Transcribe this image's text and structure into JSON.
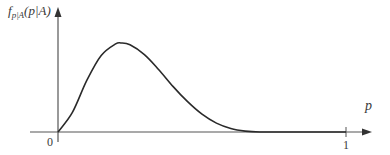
{
  "chart_data": {
    "type": "line",
    "title": "",
    "xlabel": "p",
    "ylabel": "f_{p|A}(p|A)",
    "ylabel_parts": {
      "f": "f",
      "sub": "p|A",
      "arg": "(p|A)"
    },
    "x_ticks": [
      {
        "value": 0,
        "label": "0"
      },
      {
        "value": 1,
        "label": "1"
      }
    ],
    "y_ticks": [],
    "xlim": [
      0,
      1.08
    ],
    "grid": false,
    "legend": null,
    "series": [
      {
        "name": "posterior density",
        "x": [
          0.0,
          0.05,
          0.1,
          0.15,
          0.2,
          0.22,
          0.25,
          0.3,
          0.35,
          0.4,
          0.45,
          0.5,
          0.55,
          0.6,
          0.65,
          0.7,
          0.8,
          0.9,
          1.0
        ],
        "y": [
          0.0,
          0.22,
          0.58,
          0.86,
          0.99,
          1.0,
          0.98,
          0.87,
          0.7,
          0.51,
          0.34,
          0.2,
          0.1,
          0.04,
          0.01,
          0.0,
          0.0,
          0.0,
          0.0
        ],
        "color": "#2a2a2a"
      }
    ]
  },
  "labels": {
    "ylabel_f": "f",
    "ylabel_sub": "p|A",
    "ylabel_arg": "(p|A)",
    "xlabel": "p",
    "tick0": "0",
    "tick1": "1"
  },
  "colors": {
    "axis": "#555555",
    "curve": "#2a2a2a",
    "text": "#3a3a3a"
  }
}
